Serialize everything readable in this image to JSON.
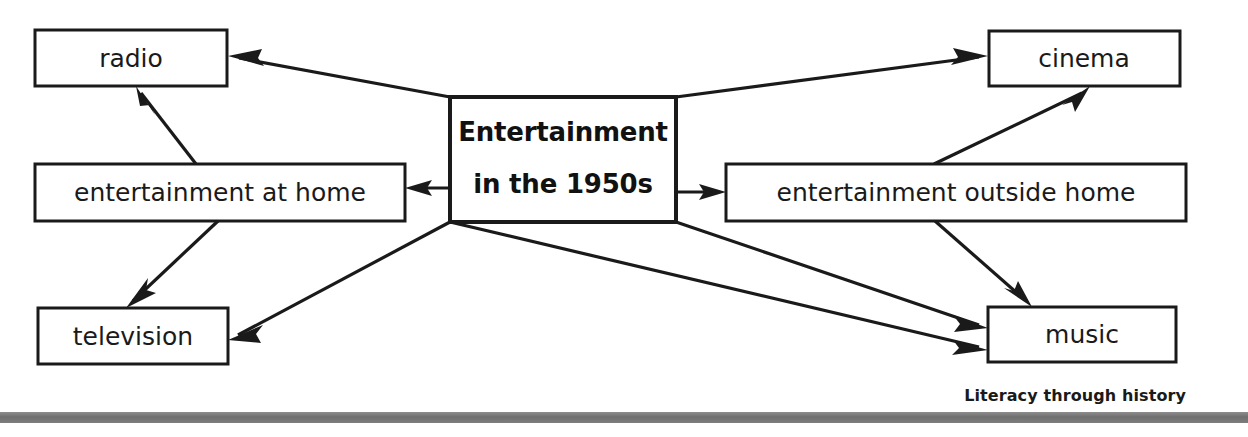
{
  "diagram": {
    "type": "concept-map",
    "title": "Entertainment in the 1950s",
    "center_node": {
      "id": "center",
      "line1": "Entertainment",
      "line2": "in the 1950s",
      "bold": true,
      "box": {
        "x": 450,
        "y": 97,
        "w": 226,
        "h": 125
      }
    },
    "nodes": [
      {
        "id": "radio",
        "label": "radio",
        "box": {
          "x": 35,
          "y": 30,
          "w": 192,
          "h": 56
        }
      },
      {
        "id": "ent_at_home",
        "label": "entertainment at home",
        "box": {
          "x": 35,
          "y": 164,
          "w": 370,
          "h": 57
        }
      },
      {
        "id": "television",
        "label": "television",
        "box": {
          "x": 38,
          "y": 308,
          "w": 190,
          "h": 56
        }
      },
      {
        "id": "cinema",
        "label": "cinema",
        "box": {
          "x": 989,
          "y": 31,
          "w": 191,
          "h": 55
        }
      },
      {
        "id": "ent_outside_home",
        "label": "entertainment outside home",
        "box": {
          "x": 726,
          "y": 164,
          "w": 460,
          "h": 57
        }
      },
      {
        "id": "music",
        "label": "music",
        "box": {
          "x": 988,
          "y": 307,
          "w": 188,
          "h": 55
        }
      }
    ],
    "edges": [
      {
        "from": "center",
        "to": "radio",
        "x1": 450,
        "y1": 97,
        "x2": 231,
        "y2": 56
      },
      {
        "from": "center",
        "to": "ent_at_home",
        "x1": 450,
        "y1": 188,
        "x2": 408,
        "y2": 188
      },
      {
        "from": "ent_at_home",
        "to": "radio",
        "x1": 196,
        "y1": 164,
        "x2": 139,
        "y2": 89
      },
      {
        "from": "ent_at_home",
        "to": "television",
        "x1": 218,
        "y1": 221,
        "x2": 129,
        "y2": 305
      },
      {
        "from": "center",
        "to": "television",
        "x1": 450,
        "y1": 222,
        "x2": 231,
        "y2": 339
      },
      {
        "from": "center",
        "to": "cinema",
        "x1": 676,
        "y1": 97,
        "x2": 986,
        "y2": 56
      },
      {
        "from": "center",
        "to": "ent_outside_home",
        "x1": 676,
        "y1": 192,
        "x2": 723,
        "y2": 192
      },
      {
        "from": "ent_outside_home",
        "to": "cinema",
        "x1": 934,
        "y1": 164,
        "x2": 1087,
        "y2": 89
      },
      {
        "from": "ent_outside_home",
        "to": "music",
        "x1": 935,
        "y1": 221,
        "x2": 1029,
        "y2": 304
      },
      {
        "from": "center",
        "to": "music",
        "x1": 676,
        "y1": 222,
        "x2": 985,
        "y2": 328
      },
      {
        "from": "center",
        "to": "music_second",
        "x1": 450,
        "y1": 222,
        "x2": 985,
        "y2": 349
      }
    ]
  },
  "footer": {
    "caption": "Literacy through history"
  },
  "colors": {
    "stroke": "#1a1a1a",
    "background": "#ffffff",
    "bottom_bar": "#777777"
  }
}
